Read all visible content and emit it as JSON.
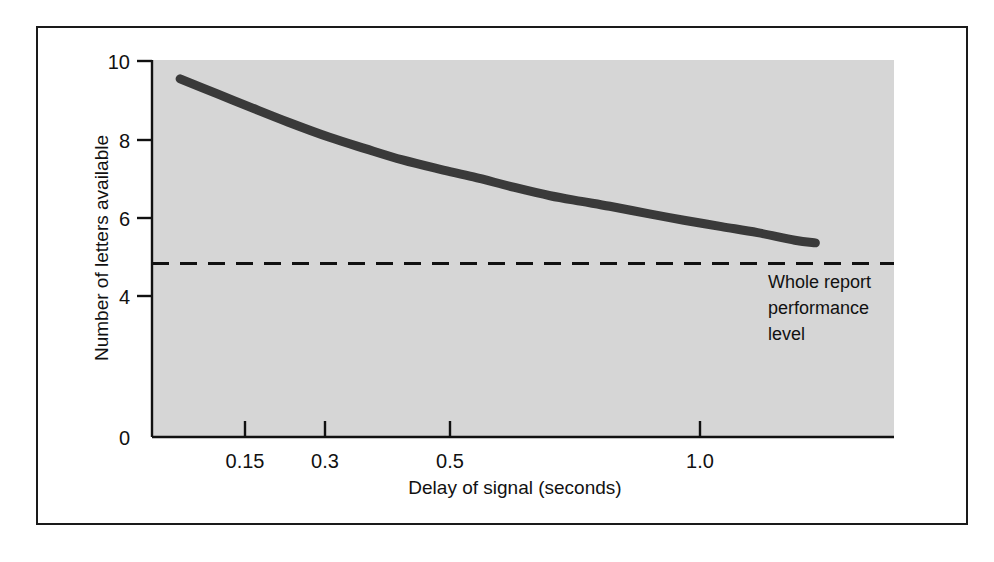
{
  "figure": {
    "background_color": "#ffffff",
    "frame_color": "#1a1a1a",
    "plot_background_color": "#d6d6d6",
    "curve_color": "#3a3a3a",
    "axis_color": "#111111"
  },
  "chart_data": {
    "type": "line",
    "title": "",
    "subtitle": "",
    "xlabel": "Delay of signal (seconds)",
    "ylabel": "Number of letters available",
    "xscale": "log",
    "x_tick_labels": [
      "0.15",
      "0.3",
      "0.5",
      "1.0"
    ],
    "x_tick_values": [
      0.15,
      0.3,
      0.5,
      1.0
    ],
    "y_tick_labels": [
      "0",
      "4",
      "6",
      "8",
      "10"
    ],
    "y_tick_values": [
      0,
      4,
      6,
      8,
      10
    ],
    "ylim": [
      0,
      10
    ],
    "xlim": [
      0.09,
      1.45
    ],
    "grid": false,
    "legend": "none",
    "series": [
      {
        "name": "Partial report performance",
        "style": "thick-solid",
        "x": [
          0.1,
          0.115,
          0.13,
          0.15,
          0.175,
          0.2,
          0.23,
          0.265,
          0.3,
          0.35,
          0.4,
          0.45,
          0.5,
          0.58,
          0.66,
          0.76,
          0.87,
          1.0,
          1.08
        ],
        "y": [
          9.5,
          9.1,
          8.75,
          8.35,
          7.95,
          7.65,
          7.35,
          7.1,
          6.9,
          6.62,
          6.4,
          6.25,
          6.12,
          5.92,
          5.75,
          5.58,
          5.42,
          5.22,
          5.15
        ]
      }
    ],
    "reference_lines": [
      {
        "name": "whole-report-performance-level",
        "orientation": "horizontal",
        "value": 4.6,
        "style": "dashed",
        "label": [
          "Whole report",
          "performance",
          "level"
        ]
      }
    ],
    "annotations": [
      {
        "name": "whole-report-annotation",
        "lines": [
          "Whole report",
          "performance",
          "level"
        ]
      }
    ]
  }
}
